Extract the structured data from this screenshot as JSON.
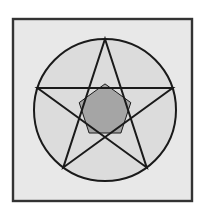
{
  "figure": {
    "title": "Pentagram inscribed in a circle",
    "canvas": {
      "width": 204,
      "height": 214,
      "background_color": "#FFFFFF"
    },
    "panel": {
      "name": "square-panel",
      "x": 13,
      "y": 19,
      "width": 179,
      "height": 182,
      "fill_color": "#E8E8E8",
      "stroke_color": "#333333",
      "stroke_width": 2.4
    },
    "circle": {
      "name": "circumscribed-circle",
      "center_x": 105,
      "center_y": 110,
      "radius": 71,
      "fill_color": "#DCDCDC",
      "stroke_color": "#1A1A1A",
      "stroke_width": 2
    },
    "star": {
      "name": "pentagram",
      "points": 5,
      "stroke_color": "#1A1A1A",
      "stroke_width": 2,
      "fill_color": "none",
      "vertices": [
        {
          "label": "apex-top",
          "x": 105,
          "y": 39
        },
        {
          "label": "right-upper",
          "x": 172.5,
          "y": 88
        },
        {
          "label": "right-lower",
          "x": 146.7,
          "y": 167.5
        },
        {
          "label": "left-lower",
          "x": 63.3,
          "y": 167.5
        },
        {
          "label": "left-upper",
          "x": 37.5,
          "y": 88
        }
      ],
      "edge_order": [
        0,
        2,
        4,
        1,
        3
      ]
    },
    "inner_pentagon": {
      "name": "inner-pentagon",
      "fill_color": "#A5A5A5",
      "stroke_color": "#1A1A1A",
      "stroke_width": 1,
      "vertices": [
        {
          "x": 105.0,
          "y": 83.9
        },
        {
          "x": 130.8,
          "y": 102.6
        },
        {
          "x": 120.9,
          "y": 133.0
        },
        {
          "x": 89.1,
          "y": 133.0
        },
        {
          "x": 79.2,
          "y": 102.6
        }
      ]
    }
  }
}
